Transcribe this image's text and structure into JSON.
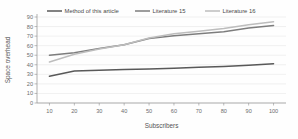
{
  "chart_data": {
    "type": "line",
    "title": "",
    "xlabel": "Subscribers",
    "ylabel": "Space overhead",
    "x": [
      10,
      20,
      30,
      40,
      50,
      60,
      70,
      80,
      90,
      100
    ],
    "xlim": [
      5,
      105
    ],
    "ylim": [
      0,
      90
    ],
    "xticks": [
      "10",
      "20",
      "30",
      "40",
      "50",
      "60",
      "70",
      "80",
      "90",
      "100"
    ],
    "yticks": [
      "0",
      "10",
      "20",
      "30",
      "40",
      "50",
      "60",
      "70",
      "80",
      "90"
    ],
    "grid": true,
    "legend_position": "top",
    "series": [
      {
        "name": "Method of this article",
        "color": "#595959",
        "values": [
          28,
          33.5,
          34.3,
          35,
          35.5,
          36.3,
          37.3,
          38.3,
          39.6,
          41
        ]
      },
      {
        "name": "Literature 15",
        "color": "#7d7d7d",
        "values": [
          50,
          52.5,
          57,
          61,
          67.5,
          70.5,
          72.5,
          74.5,
          78.5,
          81
        ]
      },
      {
        "name": "Literature 16",
        "color": "#bdbdbd",
        "values": [
          43,
          51,
          56.5,
          61,
          68,
          72.5,
          75,
          78,
          82,
          85
        ]
      }
    ]
  },
  "legend": {
    "items": [
      {
        "label": "Method of this article"
      },
      {
        "label": "Literature 15"
      },
      {
        "label": "Literature 16"
      }
    ]
  },
  "axes": {
    "x_title": "Subscribers",
    "y_title": "Space overhead"
  }
}
